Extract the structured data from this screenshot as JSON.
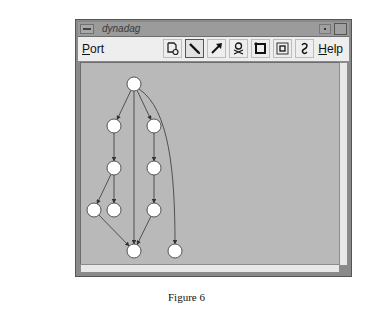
{
  "window": {
    "title": "dynadag",
    "menus": {
      "port": "Port",
      "help": "Help"
    },
    "toolbar": [
      {
        "name": "node-tool-icon",
        "active": false
      },
      {
        "name": "pencil-icon",
        "active": true
      },
      {
        "name": "arrow-icon",
        "active": false
      },
      {
        "name": "skull-crossbones-icon",
        "active": false
      },
      {
        "name": "frame-icon",
        "active": false
      },
      {
        "name": "nested-frame-icon",
        "active": false
      },
      {
        "name": "anchor-icon",
        "active": false
      }
    ]
  },
  "graph": {
    "nodes": [
      {
        "id": "n0",
        "x": 134,
        "y": 84
      },
      {
        "id": "n1",
        "x": 114,
        "y": 126
      },
      {
        "id": "n2",
        "x": 154,
        "y": 126
      },
      {
        "id": "n3",
        "x": 114,
        "y": 168
      },
      {
        "id": "n4",
        "x": 154,
        "y": 168
      },
      {
        "id": "n5",
        "x": 94,
        "y": 210
      },
      {
        "id": "n6",
        "x": 114,
        "y": 210
      },
      {
        "id": "n7",
        "x": 154,
        "y": 210
      },
      {
        "id": "n8",
        "x": 134,
        "y": 251
      },
      {
        "id": "n9",
        "x": 175,
        "y": 251
      }
    ],
    "edges": [
      [
        "n0",
        "n1"
      ],
      [
        "n0",
        "n2"
      ],
      [
        "n0",
        "n8"
      ],
      [
        "n0",
        "n9"
      ],
      [
        "n1",
        "n3"
      ],
      [
        "n2",
        "n4"
      ],
      [
        "n3",
        "n5"
      ],
      [
        "n3",
        "n6"
      ],
      [
        "n4",
        "n7"
      ],
      [
        "n5",
        "n8"
      ],
      [
        "n7",
        "n8"
      ]
    ]
  },
  "caption": "Figure 6"
}
